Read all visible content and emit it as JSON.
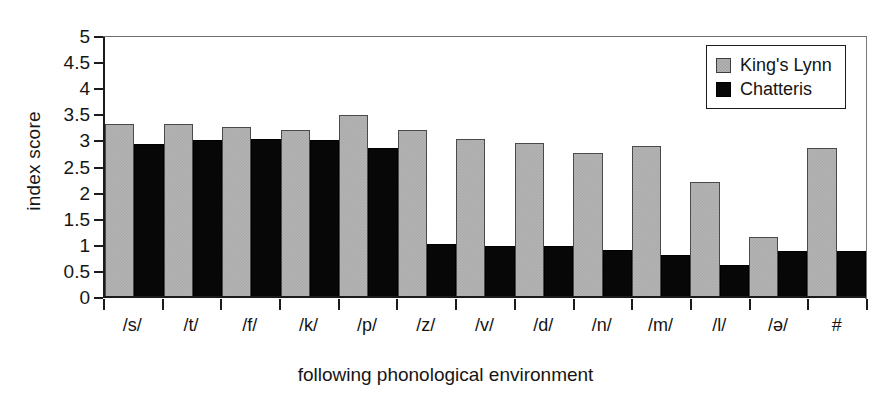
{
  "chart_data": {
    "type": "bar",
    "title": "",
    "xlabel": "following phonological environment",
    "ylabel": "index score",
    "ylim": [
      0,
      5
    ],
    "ytick_labels": [
      "5",
      "4.5",
      "4",
      "3.5",
      "3",
      "2.5",
      "2",
      "1.5",
      "1",
      "0.5",
      "0"
    ],
    "ytick_values": [
      5,
      4.5,
      4,
      3.5,
      3,
      2.5,
      2,
      1.5,
      1,
      0.5,
      0
    ],
    "grid": false,
    "legend_position": "top-right",
    "categories": [
      "/s/",
      "/t/",
      "/f/",
      "/k/",
      "/p/",
      "/z/",
      "/v/",
      "/d/",
      "/n/",
      "/m/",
      "/l/",
      "/ə/",
      "#"
    ],
    "series": [
      {
        "name": "King's Lynn",
        "color": "#b4b4b4",
        "values": [
          3.3,
          3.3,
          3.24,
          3.18,
          3.47,
          3.18,
          3.0,
          2.93,
          2.74,
          2.88,
          2.19,
          1.14,
          2.84
        ]
      },
      {
        "name": "Chatteris",
        "color": "#070707",
        "values": [
          2.91,
          2.98,
          3.0,
          2.98,
          2.84,
          0.99,
          0.95,
          0.95,
          0.89,
          0.78,
          0.59,
          0.87,
          0.87
        ]
      }
    ]
  },
  "legend": {
    "items": [
      {
        "label": "King's Lynn",
        "swatch": "gray-swatch"
      },
      {
        "label": "Chatteris",
        "swatch": "black-swatch"
      }
    ]
  }
}
